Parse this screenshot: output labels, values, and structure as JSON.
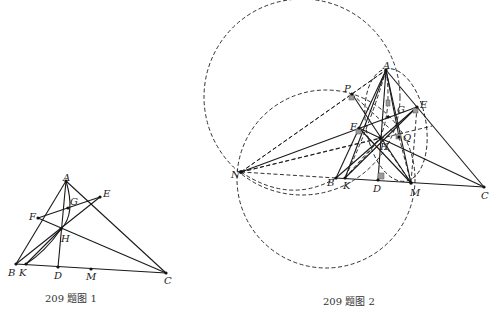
{
  "figure1": {
    "caption": "209 题图 1",
    "labels": {
      "A": "A",
      "B": "B",
      "C": "C",
      "D": "D",
      "E": "E",
      "F": "F",
      "G": "G",
      "H": "H",
      "K": "K",
      "M": "M"
    }
  },
  "figure2": {
    "caption": "209 题图 2",
    "labels": {
      "A": "A",
      "B": "B",
      "C": "C",
      "D": "D",
      "E": "E",
      "F": "F",
      "G": "G",
      "H": "H",
      "K": "K",
      "M": "M",
      "N": "N",
      "P": "P",
      "Q": "Q"
    }
  }
}
